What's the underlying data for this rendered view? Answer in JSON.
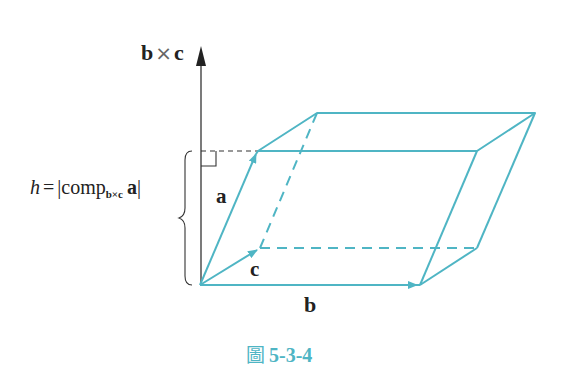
{
  "figure": {
    "caption_prefix": "圖",
    "caption_number": "5-3-4",
    "axis_label_b": "b",
    "axis_label_times": "×",
    "axis_label_c": "c",
    "vector_a_label": "a",
    "vector_b_label": "b",
    "vector_c_label": "c",
    "height_label": {
      "h": "h",
      "eq": "=",
      "bar_open": "|",
      "comp": "comp",
      "sub": "b×c",
      "vec": "a",
      "bar_close": "|"
    },
    "colors": {
      "prism": "#4fb5c4",
      "axis": "#333333",
      "caption": "#4fb5c4"
    }
  }
}
